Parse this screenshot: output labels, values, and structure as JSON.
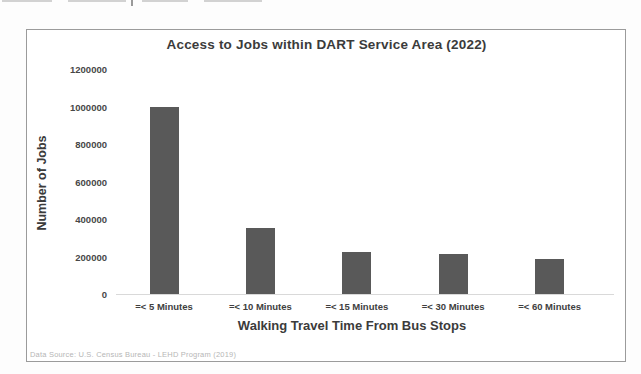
{
  "chart_data": {
    "type": "bar",
    "title": "Access to Jobs within DART Service Area (2022)",
    "categories": [
      "=< 5 Minutes",
      "=< 10 Minutes",
      "=< 15 Minutes",
      "=< 30 Minutes",
      "=< 60 Minutes"
    ],
    "values": [
      1000000,
      350000,
      225000,
      215000,
      185000
    ],
    "xlabel": "Walking Travel Time From Bus Stops",
    "ylabel": "Number of Jobs",
    "ylim": [
      0,
      1200000
    ],
    "yticks": [
      0,
      200000,
      400000,
      600000,
      800000,
      1000000,
      1200000
    ],
    "grid": false,
    "legend": "none",
    "bar_color": "#595959",
    "source_note": "Data Source: U.S. Census Bureau - LEHD Program (2019)"
  }
}
